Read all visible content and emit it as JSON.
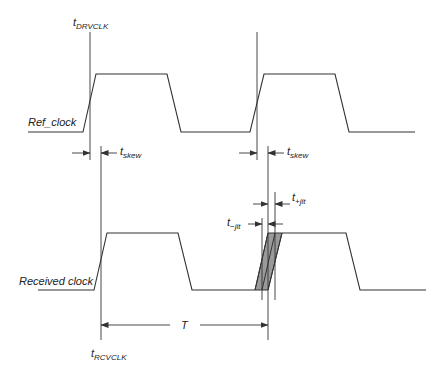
{
  "diagram": {
    "type": "timing-diagram",
    "signals": [
      {
        "name": "ref_clock",
        "label": "Ref_clock"
      },
      {
        "name": "received_clock",
        "label": "Received clock"
      }
    ],
    "labels": {
      "t_drvclk": {
        "main": "t",
        "sub": "DRVCLK"
      },
      "t_rcvclk": {
        "main": "t",
        "sub": "RCVCLK"
      },
      "t_skew_1": {
        "main": "t",
        "sub": "skew"
      },
      "t_skew_2": {
        "main": "t",
        "sub": "skew"
      },
      "t_minus_jit": {
        "main": "t",
        "sub": "−jit"
      },
      "t_plus_jit": {
        "main": "t",
        "sub": "+jit"
      },
      "period": "T"
    },
    "colors": {
      "line": "#333333",
      "jitter_fill": "#9a9a9a",
      "background": "#ffffff"
    }
  }
}
